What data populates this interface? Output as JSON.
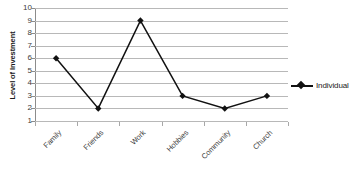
{
  "chart_data": {
    "type": "line",
    "title": "",
    "xlabel": "",
    "ylabel": "Level of Investment",
    "categories": [
      "Family",
      "Friends",
      "Work",
      "Hobbies",
      "Community",
      "Church"
    ],
    "series": [
      {
        "name": "Individual",
        "values": [
          6,
          2,
          9,
          3,
          2,
          3
        ],
        "color": "#111111",
        "marker": "diamond"
      }
    ],
    "ylim": [
      1,
      10
    ],
    "y_ticks": [
      10,
      9,
      8,
      7,
      6,
      5,
      4,
      3,
      2,
      1
    ],
    "y_tick_labels": [
      "10",
      "9",
      "8",
      "7",
      "6",
      "5",
      "4",
      "3",
      "2",
      "1"
    ],
    "grid": true,
    "grid_axis": "y",
    "legend": true,
    "legend_position": "right",
    "legend_entries": [
      "Individual"
    ],
    "background_color": "#ffffff",
    "gridline_color": "#b8b8b8",
    "axis_color": "#8c8c8c",
    "x_label_rotation": -45
  }
}
